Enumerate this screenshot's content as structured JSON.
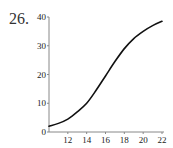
{
  "problem": {
    "number": "26."
  },
  "chart_data": {
    "type": "line",
    "title": "",
    "xlabel": "",
    "ylabel": "",
    "xlim": [
      10,
      22
    ],
    "ylim": [
      0,
      40
    ],
    "grid": false,
    "legend": null,
    "x_ticks": [
      12,
      14,
      16,
      18,
      20,
      22
    ],
    "y_ticks": [
      0,
      10,
      20,
      30,
      40
    ],
    "x_tick_labels": [
      "12",
      "14",
      "16",
      "18",
      "20",
      "22"
    ],
    "y_tick_labels": [
      "0",
      "10",
      "20",
      "30",
      "40"
    ],
    "series": [
      {
        "name": "curve",
        "color": "#111111",
        "x": [
          10,
          11,
          12,
          13,
          14,
          15,
          16,
          17,
          18,
          19,
          20,
          21,
          22
        ],
        "values": [
          2,
          3,
          4.5,
          7,
          10,
          14.5,
          19.5,
          24.5,
          29,
          32.5,
          35,
          37,
          38.5
        ]
      }
    ]
  },
  "colors": {
    "axis": "#888888",
    "curve": "#111111",
    "text": "#222222"
  }
}
